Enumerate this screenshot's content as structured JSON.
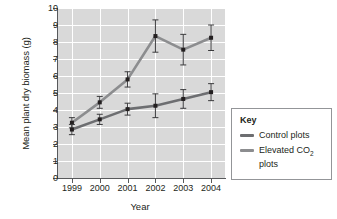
{
  "chart_data": {
    "type": "line",
    "title": "",
    "xlabel": "Year",
    "ylabel": "Mean plant dry biomass (g)",
    "categories": [
      "1999",
      "2000",
      "2001",
      "2002",
      "2003",
      "2004"
    ],
    "ylim": [
      0,
      10
    ],
    "yticks": [
      "10",
      "9",
      "8",
      "7",
      "6",
      "5",
      "4",
      "3",
      "2",
      "1",
      "0"
    ],
    "grid": true,
    "legend_position": "right",
    "series": [
      {
        "name": "Control plots",
        "color": "#6d6e71",
        "values": [
          2.85,
          3.45,
          4.05,
          4.25,
          4.65,
          5.05
        ],
        "errors": [
          0.3,
          0.3,
          0.35,
          0.7,
          0.55,
          0.5
        ]
      },
      {
        "name": "Elevated CO2 plots",
        "color": "#8c8d8f",
        "values": [
          3.25,
          4.45,
          5.8,
          8.35,
          7.55,
          8.25
        ],
        "errors": [
          0.3,
          0.35,
          0.45,
          0.95,
          0.9,
          0.75
        ]
      }
    ]
  },
  "legend": {
    "title": "Key",
    "entries": [
      {
        "label_text": "Control plots",
        "label_pre": "Control plots",
        "label_sub": "",
        "label_post": ""
      },
      {
        "label_text": "Elevated CO2 plots",
        "label_pre": "Elevated CO",
        "label_sub": "2",
        "label_post": " plots"
      }
    ]
  },
  "colors": {
    "plot_background": "#d9d9d9",
    "gridline": "#ffffff",
    "axis": "#58595b",
    "control": "#6d6e71",
    "elevated": "#8c8d8f",
    "marker": "#231f20"
  }
}
